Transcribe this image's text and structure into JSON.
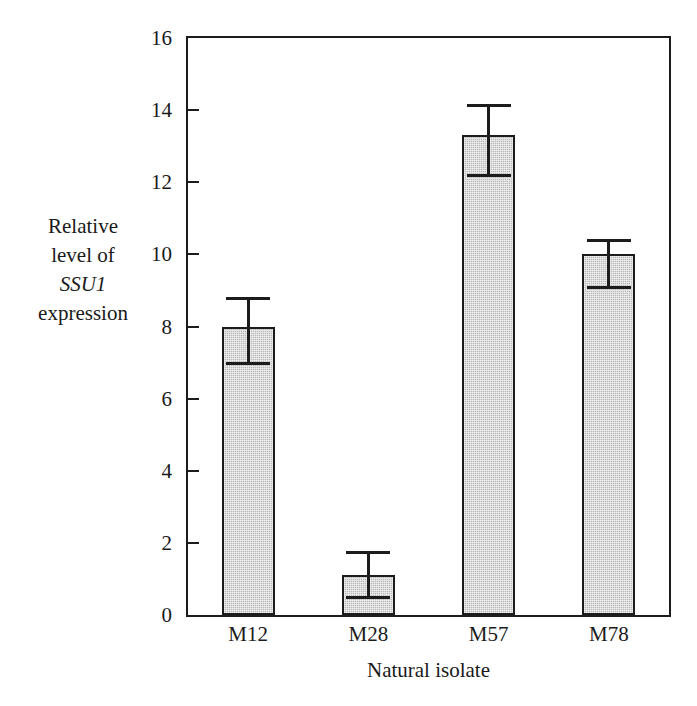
{
  "chart_data": {
    "type": "bar",
    "title": "",
    "subtitle": "",
    "xlabel": "Natural isolate",
    "ylabel": "Relative level of SSU1 expression",
    "ylabel_lines": [
      "Relative",
      "level of",
      "SSU1",
      "expression"
    ],
    "ylabel_italic_line": "SSU1",
    "categories": [
      "M12",
      "M28",
      "M57",
      "M78"
    ],
    "values": [
      8.0,
      1.1,
      13.3,
      10.0
    ],
    "error_low": [
      7.0,
      0.5,
      12.2,
      9.1
    ],
    "error_high": [
      8.8,
      1.75,
      14.15,
      10.4
    ],
    "error_bars": [
      {
        "category": "M12",
        "value": 8.0,
        "low": 7.0,
        "high": 8.8
      },
      {
        "category": "M28",
        "value": 1.1,
        "low": 0.5,
        "high": 1.75
      },
      {
        "category": "M57",
        "value": 13.3,
        "low": 12.2,
        "high": 14.15
      },
      {
        "category": "M78",
        "value": 10.0,
        "low": 9.1,
        "high": 10.4
      }
    ],
    "ylim": [
      0,
      16
    ],
    "yticks": [
      0,
      2,
      4,
      6,
      8,
      10,
      12,
      14,
      16
    ],
    "ytick_labels": [
      "0",
      "2",
      "4",
      "6",
      "8",
      "10",
      "12",
      "14",
      "16"
    ],
    "grid": false,
    "legend": false,
    "legend_position": "none",
    "frame": "box",
    "tick_direction": "in",
    "bar_fill_color": "#b9b9b9",
    "bar_edge_color": "#1c1c1c",
    "axis_color": "#1c1c1c",
    "background_color": "#ffffff"
  }
}
